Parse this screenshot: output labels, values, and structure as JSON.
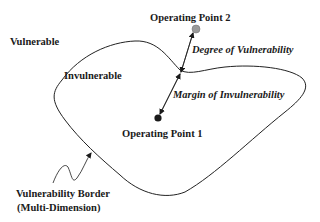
{
  "diagram": {
    "regions": {
      "outside": "Vulnerable",
      "inside": "Invulnerable"
    },
    "points": [
      {
        "id": "op1",
        "label": "Operating Point 1",
        "color": "#1a1a1a",
        "location": "inside"
      },
      {
        "id": "op2",
        "label": "Operating Point 2",
        "color": "#9a9a9a",
        "location": "outside"
      }
    ],
    "measures": {
      "degree": "Degree of Vulnerability",
      "margin": "Margin of Invulnerability"
    },
    "border": {
      "line1": "Vulnerability Border",
      "line2": "(Multi-Dimension)"
    }
  }
}
